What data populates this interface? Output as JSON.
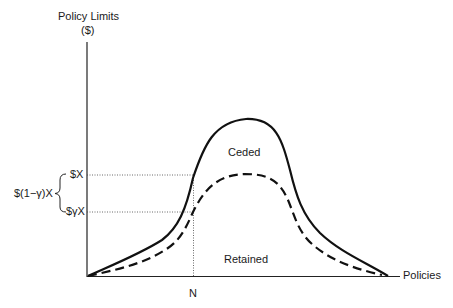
{
  "diagram": {
    "y_axis_label_line1": "Policy Limits",
    "y_axis_label_line2": "($)",
    "x_axis_label": "Policies",
    "x_marker_label": "N",
    "y_marker_upper": "$X",
    "y_marker_lower": "$γX",
    "bracket_label": "$(1−γ)X",
    "region_upper": "Ceded",
    "region_lower": "Retained",
    "curves": [
      {
        "name": "total-limit-curve",
        "style": "solid"
      },
      {
        "name": "retained-limit-curve",
        "style": "dashed"
      }
    ]
  }
}
